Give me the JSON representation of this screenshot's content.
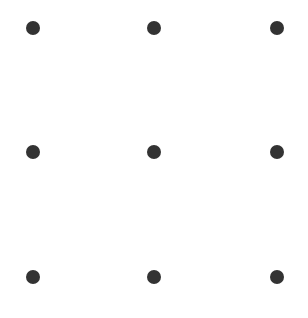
{
  "chart_data": {
    "type": "scatter",
    "title": "",
    "subtitle": "",
    "xlabel": "",
    "ylabel": "",
    "grid": false,
    "legend": null,
    "legend_position": "none",
    "background_color": "#ffffff",
    "marker": {
      "shape": "circle",
      "color": "#333333",
      "diameter_px": 14
    },
    "xlim": [
      0,
      308
    ],
    "ylim": [
      0,
      318
    ],
    "x_tick_labels": [],
    "y_tick_labels": [],
    "annotations": [],
    "x": [
      33,
      154,
      277,
      33,
      154,
      277,
      33,
      154,
      277
    ],
    "y": [
      28,
      28,
      28,
      152,
      152,
      152,
      277,
      277,
      277
    ],
    "points": [
      {
        "name": "top-left",
        "x": 33,
        "y": 28,
        "color": "#333333",
        "size": 14
      },
      {
        "name": "top-center",
        "x": 154,
        "y": 28,
        "color": "#333333",
        "size": 14
      },
      {
        "name": "top-right",
        "x": 277,
        "y": 28,
        "color": "#333333",
        "size": 14
      },
      {
        "name": "middle-left",
        "x": 33,
        "y": 152,
        "color": "#333333",
        "size": 14
      },
      {
        "name": "middle-center",
        "x": 154,
        "y": 152,
        "color": "#333333",
        "size": 14
      },
      {
        "name": "middle-right",
        "x": 277,
        "y": 152,
        "color": "#333333",
        "size": 14
      },
      {
        "name": "bottom-left",
        "x": 33,
        "y": 277,
        "color": "#333333",
        "size": 14
      },
      {
        "name": "bottom-center",
        "x": 154,
        "y": 277,
        "color": "#333333",
        "size": 14
      },
      {
        "name": "bottom-right",
        "x": 277,
        "y": 277,
        "color": "#333333",
        "size": 14
      }
    ]
  }
}
